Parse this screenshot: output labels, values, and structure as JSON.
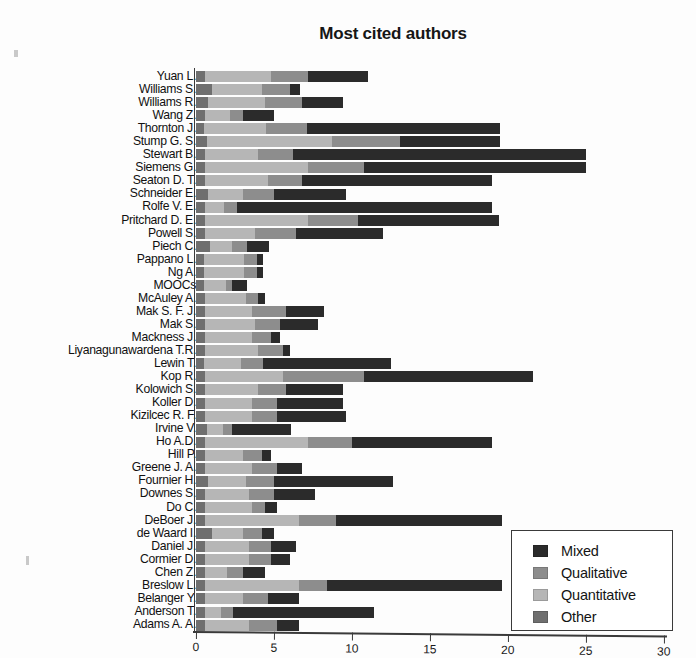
{
  "chart_data": {
    "type": "bar",
    "orientation": "horizontal",
    "stacked": true,
    "title": "Most cited authors",
    "xlabel": "",
    "ylabel": "",
    "xlim": [
      0,
      30
    ],
    "xticks": [
      0,
      5,
      10,
      15,
      20,
      25,
      30
    ],
    "grid": false,
    "legend_position": "lower-right",
    "series": [
      {
        "name": "Other",
        "color": "#6f6f6f"
      },
      {
        "name": "Quantitative",
        "color": "#b6b6b6"
      },
      {
        "name": "Qualitative",
        "color": "#8d8d8d"
      },
      {
        "name": "Mixed",
        "color": "#2b2b2b"
      }
    ],
    "categories": [
      "Yuan L.",
      "Williams S.",
      "Williams R.",
      "Wang Z.",
      "Thornton J.",
      "Stump G. S.",
      "Stewart B.",
      "Siemens G.",
      "Seaton D. T.",
      "Schneider E.",
      "Rolfe V. E.",
      "Pritchard D. E.",
      "Powell S.",
      "Piech C.",
      "Pappano L.",
      "Ng A.",
      "MOOCs",
      "McAuley A.",
      "Mak S. F. J.",
      "Mak S.",
      "Mackness J.",
      "Liyanagunawardena T.R.",
      "Lewin T.",
      "Kop R.",
      "Kolowich S.",
      "Koller D.",
      "Kizilcec R. F.",
      "Irvine V.",
      "Ho A.D.",
      "Hill P.",
      "Greene J. A.",
      "Fournier H.",
      "Downes S.",
      "Do C.",
      "DeBoer J.",
      "de Waard I.",
      "Daniel J.",
      "Cormier D.",
      "Chen Z.",
      "Breslow L.",
      "Belanger Y.",
      "Anderson T.",
      "Adams A. A."
    ],
    "values": {
      "Other": [
        0.6,
        1.0,
        0.8,
        0.6,
        0.5,
        0.7,
        0.6,
        0.6,
        0.6,
        0.8,
        0.6,
        0.6,
        0.6,
        0.9,
        0.5,
        0.5,
        0.5,
        0.6,
        0.6,
        0.6,
        0.6,
        0.6,
        0.5,
        0.6,
        0.6,
        0.6,
        0.6,
        0.7,
        0.6,
        0.6,
        0.6,
        0.8,
        0.6,
        0.6,
        0.6,
        1.0,
        0.6,
        0.6,
        0.6,
        0.6,
        0.6,
        0.6,
        0.6
      ],
      "Quantitative": [
        4.2,
        3.2,
        3.6,
        1.6,
        4.0,
        8.0,
        3.4,
        6.6,
        4.0,
        2.2,
        1.2,
        6.6,
        3.2,
        1.4,
        2.6,
        2.6,
        1.4,
        2.6,
        3.0,
        3.2,
        3.0,
        3.4,
        2.4,
        5.0,
        3.4,
        3.0,
        3.0,
        1.0,
        6.6,
        2.4,
        3.0,
        2.4,
        2.8,
        3.0,
        6.0,
        2.0,
        2.8,
        2.8,
        1.4,
        6.0,
        2.4,
        1.0,
        2.8
      ],
      "Qualitative": [
        2.4,
        1.8,
        2.4,
        0.8,
        2.6,
        4.4,
        2.2,
        3.6,
        2.2,
        2.0,
        0.8,
        3.2,
        2.6,
        1.0,
        0.8,
        0.8,
        0.4,
        0.8,
        2.2,
        1.6,
        1.2,
        1.6,
        1.4,
        5.2,
        1.8,
        1.6,
        1.6,
        0.6,
        2.8,
        1.2,
        1.6,
        1.8,
        1.6,
        0.8,
        2.4,
        1.2,
        1.4,
        1.4,
        1.0,
        1.8,
        1.6,
        0.8,
        1.8
      ],
      "Mixed": [
        3.8,
        0.7,
        2.6,
        2.0,
        12.4,
        6.4,
        18.8,
        14.2,
        12.2,
        4.6,
        16.4,
        9.0,
        5.6,
        1.4,
        0.4,
        0.4,
        1.0,
        0.4,
        2.4,
        2.4,
        0.6,
        0.4,
        8.2,
        10.8,
        3.6,
        4.2,
        4.4,
        3.8,
        9.0,
        0.6,
        1.6,
        7.6,
        2.6,
        0.8,
        10.6,
        0.8,
        1.6,
        1.2,
        1.4,
        11.2,
        2.0,
        9.0,
        1.4
      ]
    },
    "totals": [
      11.0,
      6.7,
      9.4,
      5.0,
      19.5,
      19.5,
      25.0,
      25.0,
      19.0,
      9.6,
      19.0,
      19.4,
      12.0,
      4.7,
      4.3,
      4.3,
      3.3,
      4.4,
      8.2,
      7.8,
      5.4,
      6.0,
      12.5,
      21.6,
      9.4,
      9.4,
      9.6,
      6.1,
      19.0,
      4.8,
      6.8,
      12.6,
      7.6,
      5.2,
      19.6,
      5.0,
      6.4,
      6.0,
      4.4,
      19.6,
      6.6,
      11.4,
      6.6
    ]
  },
  "legend": {
    "items": [
      {
        "label": "Mixed",
        "swatch": "mixed"
      },
      {
        "label": "Qualitative",
        "swatch": "qual"
      },
      {
        "label": "Quantitative",
        "swatch": "quant"
      },
      {
        "label": "Other",
        "swatch": "other"
      }
    ]
  }
}
